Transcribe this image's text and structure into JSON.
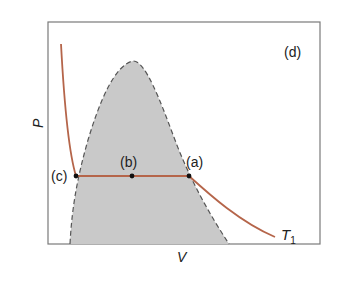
{
  "diagram": {
    "panel_label": "(d)",
    "x_axis_label": "V",
    "y_axis_label": "P",
    "isotherm_label": "T",
    "isotherm_subscript": "1",
    "points": [
      {
        "id": "a",
        "label": "(a)"
      },
      {
        "id": "b",
        "label": "(b)"
      },
      {
        "id": "c",
        "label": "(c)"
      }
    ],
    "colors": {
      "isotherm": "#b5654a",
      "dome_fill": "#c9c9c9",
      "dome_border": "#555555",
      "frame": "#777777",
      "point": "#111111"
    }
  }
}
